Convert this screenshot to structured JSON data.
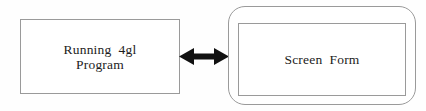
{
  "diagram": {
    "background_color": "#fefefe",
    "stroke_color": "#9a9a9a",
    "text_color": "#1c1c1c",
    "arrow_color": "#111111",
    "nodes": {
      "program": {
        "shape": "rectangle",
        "line1": "Running  4gl",
        "line2": "Program"
      },
      "screen_form": {
        "shape": "rounded-rectangle-with-inner-rectangle",
        "label": "Screen  Form"
      }
    },
    "connector": {
      "icon": "double-headed-arrow",
      "direction": "bidirectional",
      "label": ""
    }
  }
}
